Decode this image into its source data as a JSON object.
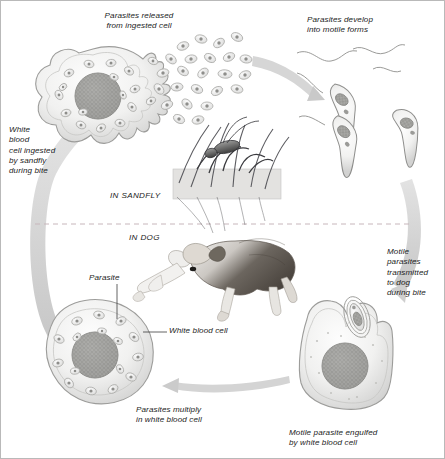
{
  "figure": {
    "background_color": "#ffffff",
    "border_color": "#b9b9b9",
    "arrow_color": "#cfcfcf",
    "divider_color": "#c9b8bd",
    "ink_color": "#1c1c1c"
  },
  "sections": {
    "sandfly_label": "IN SANDFLY",
    "dog_label": "IN DOG"
  },
  "labels": {
    "parasites_released": "Parasites released\nfrom ingested cell",
    "parasites_develop": "Parasites develop\ninto motile forms",
    "white_blood_cell_ingested": "White\nblood\ncell ingested\nby sandfly\nduring bite",
    "motile_transmitted": "Motile\nparasites\ntransmitted\nto dog\nduring bite",
    "parasites_multiply": "Parasites multiply\nin white blood cell",
    "motile_engulfed": "Motile parasite engulfed\nby white blood cell"
  },
  "callouts": {
    "parasite": "Parasite",
    "white_blood_cell": "White blood cell"
  },
  "illustrations": {
    "infected_cell_top_left": "white-blood-cell-packed-with-amastigotes",
    "released_parasites": "scattered-oval-amastigotes",
    "promastigotes": "three-flagellated-motile-parasites",
    "sandfly": "sandfly-feeding-on-skin",
    "dog": "dog-lying-down",
    "multiplying_cell": "white-blood-cell-with-multiplying-parasites",
    "engulfing_cell": "white-blood-cell-engulfing-motile-parasite"
  }
}
